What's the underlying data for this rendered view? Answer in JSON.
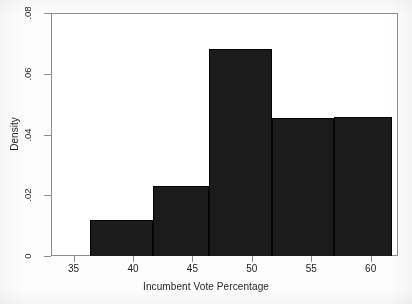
{
  "chart_data": {
    "type": "bar",
    "title": "",
    "subtitle": "",
    "xlabel": "Incumbent Vote Percentage",
    "ylabel": "Density",
    "xlim": [
      33.1,
      62.3
    ],
    "ylim": [
      0,
      0.08
    ],
    "grid": false,
    "legend": false,
    "bar_color": "#1b1b1b",
    "frame_color": "#8d8d8d",
    "background": "#ffffff",
    "xticks": [
      35,
      40,
      45,
      50,
      55,
      60
    ],
    "xtick_labels": [
      "35",
      "40",
      "45",
      "50",
      "55",
      "60"
    ],
    "yticks": [
      0,
      0.02,
      0.04,
      0.06,
      0.08
    ],
    "ytick_labels": [
      "0",
      ".02",
      ".04",
      ".06",
      ".08"
    ],
    "bin_edges": [
      36.4,
      41.7,
      46.4,
      51.7,
      56.9,
      61.8
    ],
    "categories": [
      "36.4-41.7",
      "41.7-46.4",
      "46.4-51.7",
      "51.7-56.9",
      "56.9-61.8"
    ],
    "values": [
      0.0119,
      0.0229,
      0.068,
      0.0454,
      0.0458
    ],
    "bars": [
      {
        "label": "36.4-41.7",
        "x0": 36.4,
        "x1": 41.7,
        "value": 0.0119
      },
      {
        "label": "41.7-46.4",
        "x0": 41.7,
        "x1": 46.4,
        "value": 0.0229
      },
      {
        "label": "46.4-51.7",
        "x0": 46.4,
        "x1": 51.7,
        "value": 0.068
      },
      {
        "label": "51.7-56.9",
        "x0": 51.7,
        "x1": 56.9,
        "value": 0.0454
      },
      {
        "label": "56.9-61.8",
        "x0": 56.9,
        "x1": 61.8,
        "value": 0.0458
      }
    ]
  }
}
